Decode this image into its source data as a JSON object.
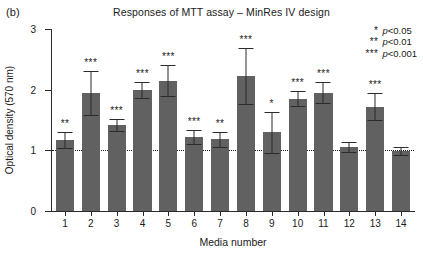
{
  "figure": {
    "panel_label": "(b)",
    "title": "Responses of MTT assay – MinRes IV design"
  },
  "legend": {
    "items": [
      {
        "stars": "*",
        "text": "p<0.05"
      },
      {
        "stars": "**",
        "text": "p<0.01"
      },
      {
        "stars": "***",
        "text": "p<0.001"
      }
    ]
  },
  "chart_data": {
    "type": "bar",
    "title": "Responses of MTT assay – MinRes IV design",
    "xlabel": "Media number",
    "ylabel": "Optical density (570 nm)",
    "categories": [
      "1",
      "2",
      "3",
      "4",
      "5",
      "6",
      "7",
      "8",
      "9",
      "10",
      "11",
      "12",
      "13",
      "14"
    ],
    "values": [
      1.17,
      1.95,
      1.42,
      2.0,
      2.15,
      1.22,
      1.18,
      2.22,
      1.3,
      1.85,
      1.95,
      1.06,
      1.72,
      0.99
    ],
    "errors": [
      0.13,
      0.36,
      0.1,
      0.13,
      0.25,
      0.12,
      0.13,
      0.46,
      0.34,
      0.12,
      0.17,
      0.08,
      0.22,
      0.07
    ],
    "significance": [
      "**",
      "***",
      "***",
      "***",
      "***",
      "***",
      "**",
      "***",
      "*",
      "***",
      "***",
      "",
      "***",
      ""
    ],
    "ylim": [
      0,
      3
    ],
    "yticks": [
      0,
      1,
      2,
      3
    ],
    "ytick_labels": [
      "0",
      "1",
      "2",
      "3"
    ],
    "reference_line": 1.0,
    "bar_color": "#616161",
    "grid": false,
    "legend_position": "top-right"
  }
}
